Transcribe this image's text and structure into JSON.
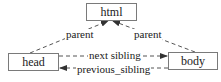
{
  "diagram": {
    "type": "tree-relationships",
    "nodes": {
      "html": {
        "label": "html"
      },
      "head": {
        "label": "head"
      },
      "body": {
        "label": "body"
      }
    },
    "edges": {
      "head_parent": {
        "from": "head",
        "to": "html",
        "label": "parent",
        "style": "dashed",
        "arrow": "end"
      },
      "body_parent": {
        "from": "body",
        "to": "html",
        "label": "parent",
        "style": "dashed",
        "arrow": "end"
      },
      "next_sibling": {
        "from": "head",
        "to": "body",
        "label": "next sibling",
        "style": "dashed",
        "arrow": "end"
      },
      "previous_sibling": {
        "from": "body",
        "to": "head",
        "label": "previous_sibling",
        "style": "dashed",
        "arrow": "end"
      }
    },
    "colors": {
      "line": "#555555",
      "box_border": "#7a7a7a",
      "text": "#1a1a1a",
      "background": "#ffffff"
    }
  }
}
